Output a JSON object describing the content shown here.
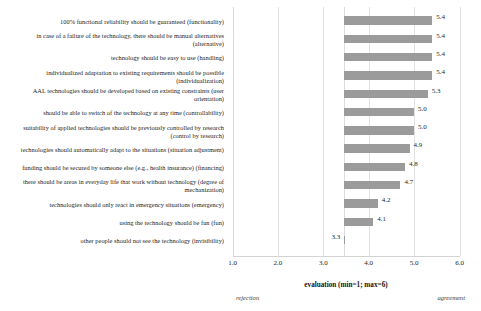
{
  "chart_data": {
    "type": "bar",
    "orientation": "horizontal",
    "title": "",
    "xlabel": "evaluation (min=1; max=6)",
    "ylabel": "",
    "xlim": [
      1.0,
      6.0
    ],
    "xticks": [
      "1.0",
      "2.0",
      "3.0",
      "4.0",
      "5.0",
      "6.0"
    ],
    "xtick_values": [
      1.0,
      2.0,
      3.0,
      4.0,
      5.0,
      6.0
    ],
    "grid": true,
    "legend": null,
    "bar_color": "#9b9b9b",
    "scale_anchor_low": "rejection",
    "scale_anchor_high": "agreement",
    "categories": [
      "100% functional reliability should be guaranteed (functionality)",
      "in case of a failure of the technology, there should be manual alternatives (alternative)",
      "technology should be easy to use (handling)",
      "individualized adaptation to existing requirements should be possible (individualization)",
      "AAL technologies should be developed based on existing constraints (user orientation)",
      "should be able to switch of the technology at any time (controllability)",
      "suitability of  applied technologies should be previously controlled by research (control by research)",
      "technologies should automatically adapt to the situations (situation adjustment)",
      "funding should be secured by someone else (e.g., health insurance) (financing)",
      "there should be areas in everyday life that work without technology (degree of mechanization)",
      "technologies should only react in emergency situations (emergency)",
      "using the technology should be fun (fun)",
      "other people should not see the technology (invisibility)"
    ],
    "values": [
      5.4,
      5.4,
      5.4,
      5.4,
      5.3,
      5.0,
      5.0,
      4.9,
      4.8,
      4.7,
      4.2,
      4.1,
      3.3
    ],
    "value_labels": [
      "5.4",
      "5.4",
      "5.4",
      "5.4",
      "5.3",
      "5.0",
      "5.0",
      "4.9",
      "4.8",
      "4.7",
      "4.2",
      "4.1",
      "3.3"
    ]
  }
}
